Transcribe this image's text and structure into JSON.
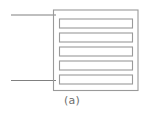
{
  "figure": {
    "caption": "(a)",
    "label": "(a)",
    "type": "interdigitated-electrode-schematic",
    "colors": {
      "stroke": "#808080",
      "stroke_light": "#9a9a9a",
      "background": "#ffffff",
      "caption": "#6e6e6e"
    },
    "geometry": {
      "canvas_width": 144,
      "canvas_height": 119,
      "outer_box": {
        "x": 53,
        "y": 9.5,
        "width": 84.5,
        "height": 80.5
      },
      "finger_count": 5,
      "finger_bar_height": 9,
      "finger_inset": 6,
      "finger_gap": 5.5,
      "stroke_width": 1
    },
    "leads": [
      {
        "name": "top-lead",
        "x1": 11,
        "y1": 15,
        "x2": 56,
        "y2": 15
      },
      {
        "name": "bottom-lead",
        "x1": 11,
        "y1": 80.5,
        "x2": 56,
        "y2": 80.5
      }
    ],
    "fingers": [
      {
        "index": 1,
        "x": 59,
        "y": 18.5,
        "width": 73,
        "height": 9,
        "anchor": "left"
      },
      {
        "index": 2,
        "x": 59,
        "y": 32.5,
        "width": 73,
        "height": 9,
        "anchor": "right"
      },
      {
        "index": 3,
        "x": 59,
        "y": 46.5,
        "width": 73,
        "height": 9,
        "anchor": "left"
      },
      {
        "index": 4,
        "x": 59,
        "y": 60.5,
        "width": 73,
        "height": 9,
        "anchor": "right"
      },
      {
        "index": 5,
        "x": 59,
        "y": 74.5,
        "width": 73,
        "height": 9,
        "anchor": "left"
      }
    ]
  }
}
